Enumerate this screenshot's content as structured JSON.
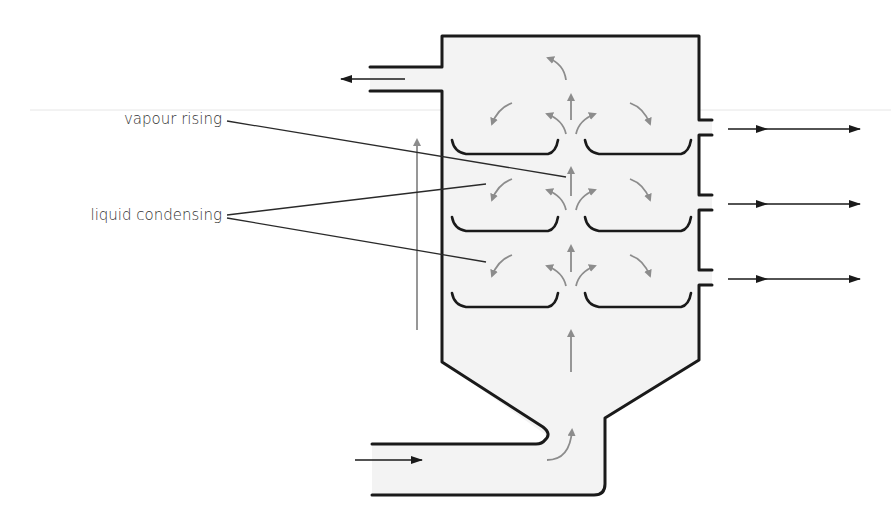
{
  "diagram": {
    "labels": {
      "vapour_rising": "vapour rising",
      "liquid_condensing": "liquid condensing"
    },
    "colors": {
      "column_fill": "#f3f3f3",
      "wall": "#1a1a1a",
      "vapour_arrows": "#8c8c8c",
      "flow_arrows": "#1a1a1a",
      "text": "#333333"
    },
    "trays": {
      "rows": 3,
      "per_row": 2
    },
    "side_outlets": 3,
    "top_outlet": "vapour outlet (left, arrow pointing left)",
    "bottom_inlet": "feed inlet (bottom-left, arrow pointing right)",
    "icons": [
      "arrow-left-icon",
      "arrow-right-icon",
      "arrow-up-icon",
      "curved-arrow-icon"
    ]
  }
}
